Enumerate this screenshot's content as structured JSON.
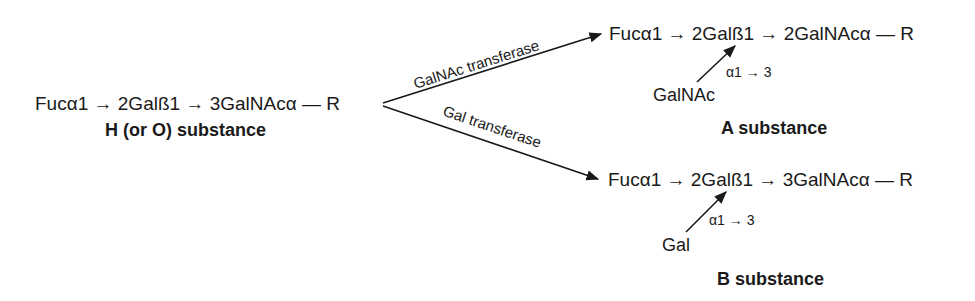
{
  "diagram": {
    "precursor": {
      "chain": "Fucα1 → 2Galß1 → 3GalNAcα — R",
      "name": "H (or O) substance"
    },
    "pathways": [
      {
        "enzyme": "GalNAc transferase",
        "product": {
          "chain": "Fucα1 → 2Galß1 → 2GalNAcα — R",
          "added_sugar": "GalNAc",
          "linkage": "α1 → 3",
          "name": "A substance"
        }
      },
      {
        "enzyme": "Gal transferase",
        "product": {
          "chain": "Fucα1 → 2Galß1 → 3GalNAcα — R",
          "added_sugar": "Gal",
          "linkage": "α1 → 3",
          "name": "B substance"
        }
      }
    ],
    "colors": {
      "ink": "#1a1a1a",
      "background": "#ffffff"
    }
  }
}
